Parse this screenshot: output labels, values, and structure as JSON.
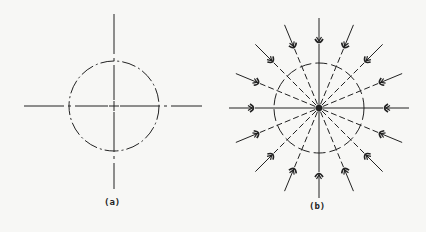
{
  "figures": [
    {
      "id": "a",
      "caption": "(a)",
      "center": [
        114,
        106
      ],
      "circle_radius": 45,
      "axes": {
        "h": [
          24,
          202
        ],
        "v": [
          14,
          189
        ]
      },
      "caption_pos": [
        104,
        197
      ]
    },
    {
      "id": "b",
      "caption": "(b)",
      "center": [
        319,
        108
      ],
      "circle_radius": 45,
      "rays": 16,
      "outer_radius": 90,
      "arrow_radius": 68,
      "caption_pos": [
        309,
        201
      ]
    }
  ],
  "colors": {
    "ink": "#222222",
    "background": "#f7f7f5"
  }
}
